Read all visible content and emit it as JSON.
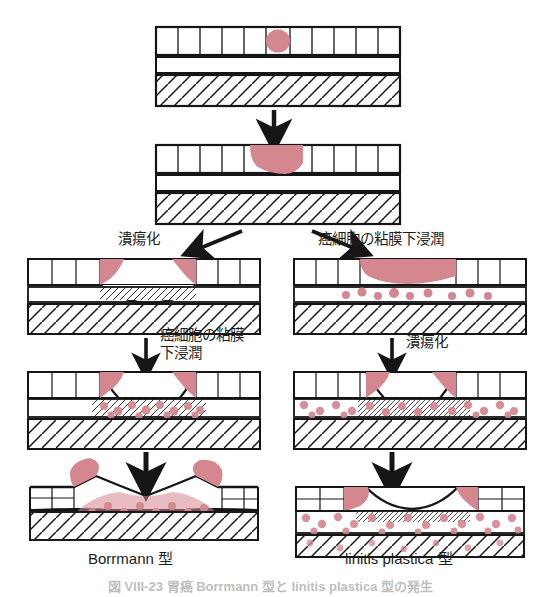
{
  "figure": {
    "title_visible_partial": "図 VIII-23 胃癌 Borrmann 型と linitis plastica 型の発生",
    "stage_labels": {
      "branch_left": "潰瘍化",
      "branch_right": "癌細胞の粘膜下浸潤",
      "mid_left_line1": "癌細胞の粘膜",
      "mid_left_line2": "下浸潤",
      "mid_right": "潰瘍化"
    },
    "captions": {
      "left": "Borrmann 型",
      "right": "linitis plastica 型"
    },
    "colors": {
      "tumor_pink": "#d4878f",
      "tumor_pink_light": "#e0a0a6",
      "line_black": "#151515",
      "background": "#ffffff"
    },
    "panels": [
      {
        "id": "panel-origin",
        "row": 1,
        "column": "center",
        "description": "正常胃壁と粘膜内の微小癌巣",
        "lesion": "small round intramucosal tumor focus"
      },
      {
        "id": "panel-mucosal-tumor",
        "row": 2,
        "column": "center",
        "description": "粘膜内に限局した癌の増大",
        "lesion": "cup shaped mucosal tumor mass"
      },
      {
        "id": "panel-left-ulcer",
        "row": 3,
        "column": "left",
        "description": "潰瘍化した粘膜内癌",
        "lesion": "ulcer crater with tumor at raised margins"
      },
      {
        "id": "panel-right-submucosal",
        "row": 3,
        "column": "right",
        "description": "粘膜下層へ浸潤する癌細胞",
        "lesion": "intact surface tumor with scattered submucosal cells"
      },
      {
        "id": "panel-left-invasion",
        "row": 4,
        "column": "left",
        "description": "潰瘍底から粘膜下層へ浸潤",
        "lesion": "ulcer with localized submucosal tumor infiltration"
      },
      {
        "id": "panel-right-ulcer",
        "row": 4,
        "column": "right",
        "description": "びまん性浸潤に潰瘍化が加わる",
        "lesion": "ulcer with widespread scattered submucosal cells"
      },
      {
        "id": "panel-borrmann",
        "row": 5,
        "column": "left",
        "description": "限局性の腫瘤を形成する Borrmann 型",
        "lesion": "dense localized tumor mass with rolled elevated edges"
      },
      {
        "id": "panel-linitis",
        "row": 5,
        "column": "right",
        "description": "壁全層にびまん性に広がる linitis plastica 型",
        "lesion": "diffuse scattered tumor cells through entire wall"
      }
    ],
    "wall_layers": [
      "粘膜 (mucosa, vertical crypt pattern)",
      "粘膜下層 (submucosa, clear band)",
      "固有筋層 (muscularis propria, diagonal hatching)"
    ],
    "arrows": [
      {
        "id": "arrow-1",
        "from": "panel-origin",
        "to": "panel-mucosal-tumor",
        "direction": "down"
      },
      {
        "id": "arrow-branch-left",
        "from": "panel-mucosal-tumor",
        "to": "panel-left-ulcer",
        "direction": "down-left"
      },
      {
        "id": "arrow-branch-right",
        "from": "panel-mucosal-tumor",
        "to": "panel-right-submucosal",
        "direction": "down-right"
      },
      {
        "id": "arrow-left-mid",
        "from": "panel-left-ulcer",
        "to": "panel-left-invasion",
        "direction": "down"
      },
      {
        "id": "arrow-right-mid",
        "from": "panel-right-submucosal",
        "to": "panel-right-ulcer",
        "direction": "down"
      },
      {
        "id": "arrow-left-bottom",
        "from": "panel-left-invasion",
        "to": "panel-borrmann",
        "direction": "down"
      },
      {
        "id": "arrow-right-bottom",
        "from": "panel-right-ulcer",
        "to": "panel-linitis",
        "direction": "down"
      }
    ]
  }
}
